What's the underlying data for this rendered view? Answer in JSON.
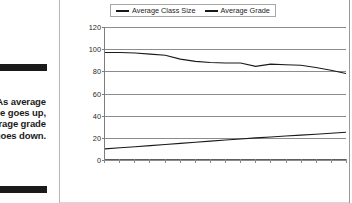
{
  "figure": {
    "caption_number": "17-8:",
    "caption_body": "As average class size goes up, the average grade goes down.",
    "caption_visible_fragments": [
      "17-8:",
      "rage",
      "size",
      ", the",
      "rage",
      "goes",
      "own."
    ]
  },
  "colors": {
    "line": "#1a1a1a",
    "gridline": "#8c8c8c",
    "axis": "#7d7d7d",
    "text": "#1d1d1d",
    "background": "#ffffff",
    "rule_bar": "#1a1a1a"
  },
  "legend": {
    "position": "top-center",
    "items": [
      {
        "label": "Average Class Size",
        "swatch": "line-swatch"
      },
      {
        "label": "Average Grade",
        "swatch": "line-swatch"
      }
    ]
  },
  "chart_data": {
    "type": "line",
    "title": "",
    "subtitle": "",
    "xlabel": "",
    "ylabel": "",
    "grid": true,
    "legend_position": "top-center",
    "ylim": [
      0,
      120
    ],
    "yticks": [
      0,
      20,
      40,
      60,
      80,
      100,
      120
    ],
    "ytick_labels": [
      "0",
      "20",
      "40",
      "60",
      "80",
      "100",
      "120"
    ],
    "xtick_count": 17,
    "xtick_labels": [],
    "x": [
      1,
      2,
      3,
      4,
      5,
      6,
      7,
      8,
      9,
      10,
      11,
      12,
      13,
      14,
      15,
      16,
      17
    ],
    "series": [
      {
        "name": "Average Grade",
        "values": [
          97,
          97,
          96.5,
          95.5,
          94.5,
          91,
          89,
          88,
          87.5,
          87.5,
          84.5,
          86.5,
          86,
          85.5,
          83.5,
          81,
          78
        ]
      },
      {
        "name": "Average Class Size",
        "values": [
          10,
          11,
          12,
          13,
          14,
          15,
          16,
          17,
          18,
          19,
          20,
          20.8,
          21.6,
          22.4,
          23.2,
          24.2,
          25
        ]
      }
    ]
  }
}
